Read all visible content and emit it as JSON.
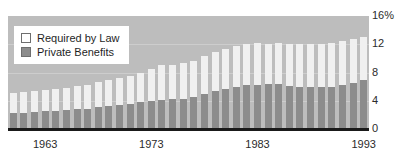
{
  "title_remnant": "",
  "legend": {
    "position": "top-left",
    "items": [
      {
        "label": "Required by Law",
        "color": "#ffffff",
        "name": "required-by-law"
      },
      {
        "label": "Private Benefits",
        "color": "#8c8c8c",
        "name": "private-benefits"
      }
    ]
  },
  "axes": {
    "y_ticks": [
      {
        "label": "16%",
        "value": 16
      },
      {
        "label": "12",
        "value": 12
      },
      {
        "label": "8",
        "value": 8
      },
      {
        "label": "4",
        "value": 4
      },
      {
        "label": "0",
        "value": 0
      }
    ],
    "x_ticks": [
      {
        "label": "1963",
        "value": 1963
      },
      {
        "label": "1973",
        "value": 1973
      },
      {
        "label": "1983",
        "value": 1983
      },
      {
        "label": "1993",
        "value": 1993
      }
    ]
  },
  "chart_data": {
    "type": "bar",
    "stacked": true,
    "title": "",
    "subtitle": "",
    "xlabel": "",
    "ylabel": "",
    "ylim": [
      0,
      16
    ],
    "yunit": "%",
    "grid": true,
    "legend_position": "top-left",
    "categories": [
      "1960",
      "1961",
      "1962",
      "1963",
      "1964",
      "1965",
      "1966",
      "1967",
      "1968",
      "1969",
      "1970",
      "1971",
      "1972",
      "1973",
      "1974",
      "1975",
      "1976",
      "1977",
      "1978",
      "1979",
      "1980",
      "1981",
      "1982",
      "1983",
      "1984",
      "1985",
      "1986",
      "1987",
      "1988",
      "1989",
      "1990",
      "1991",
      "1992",
      "1993"
    ],
    "series": [
      {
        "name": "Private Benefits",
        "color": "#8c8c8c",
        "values": [
          2.2,
          2.3,
          2.4,
          2.5,
          2.6,
          2.7,
          2.8,
          2.9,
          3.1,
          3.2,
          3.4,
          3.6,
          3.8,
          4.0,
          4.1,
          4.2,
          4.3,
          4.6,
          5.0,
          5.4,
          5.7,
          6.0,
          6.2,
          6.2,
          6.4,
          6.4,
          6.1,
          5.9,
          5.9,
          5.9,
          6.0,
          6.2,
          6.5,
          6.9
        ]
      },
      {
        "name": "Required by Law",
        "color": "#f0f0f0",
        "values": [
          2.9,
          2.9,
          3.0,
          3.0,
          3.1,
          3.1,
          3.3,
          3.4,
          3.5,
          3.7,
          3.8,
          3.9,
          4.2,
          4.5,
          4.9,
          4.9,
          5.0,
          5.1,
          5.3,
          5.5,
          5.6,
          5.8,
          5.9,
          6.0,
          5.7,
          5.8,
          6.0,
          6.1,
          6.1,
          6.2,
          6.2,
          6.3,
          6.3,
          6.1
        ]
      }
    ],
    "totals": [
      5.1,
      5.2,
      5.4,
      5.5,
      5.7,
      5.8,
      6.1,
      6.3,
      6.6,
      6.9,
      7.2,
      7.5,
      8.0,
      8.5,
      9.0,
      9.1,
      9.3,
      9.7,
      10.3,
      10.9,
      11.3,
      11.8,
      12.1,
      12.2,
      12.1,
      12.2,
      12.1,
      12.0,
      12.0,
      12.1,
      12.2,
      12.5,
      12.8,
      13.0
    ]
  }
}
